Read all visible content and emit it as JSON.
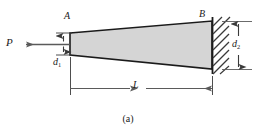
{
  "figure": {
    "caption": "(a)",
    "labels": {
      "force": "P",
      "point_left": "A",
      "point_right": "B",
      "depth_left_base": "d",
      "depth_left_sub": "1",
      "depth_right_base": "d",
      "depth_right_sub": "2",
      "length": "L"
    },
    "colors": {
      "bar_fill": "#d5d5d5",
      "outline": "#1a1a1a",
      "dimension_line": "#5a5a5a",
      "hatch": "#3a3a3a",
      "background": "#ffffff"
    },
    "geometry": {
      "bar_left_x": 70,
      "bar_right_x": 212,
      "bar_top_left_y": 33,
      "bar_top_right_y": 21,
      "bar_bottom_left_y": 55,
      "bar_bottom_right_y": 69,
      "wall_x": 212,
      "wall_top_y": 17,
      "wall_bottom_y": 74,
      "hatch_width": 16,
      "force_arrow_y": 44,
      "force_arrow_tail_x": 70,
      "force_arrow_tip_x": 26,
      "d1_dim_x": 63,
      "d2_dim_x": 238,
      "length_dim_y": 88
    }
  }
}
